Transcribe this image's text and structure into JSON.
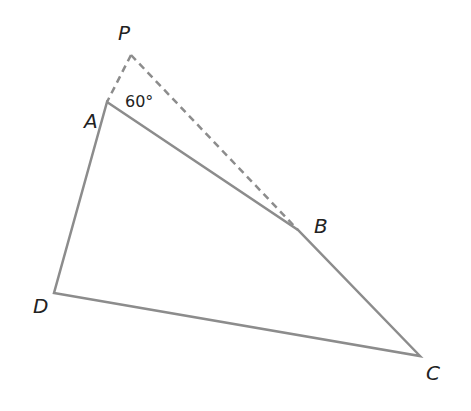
{
  "diagram": {
    "type": "geometry-quadrilateral",
    "points": {
      "P": {
        "label": "P",
        "x": 131,
        "y": 55
      },
      "A": {
        "label": "A",
        "x": 107,
        "y": 102
      },
      "B": {
        "label": "B",
        "x": 298,
        "y": 230
      },
      "C": {
        "label": "C",
        "x": 420,
        "y": 356
      },
      "D": {
        "label": "D",
        "x": 54,
        "y": 293
      }
    },
    "solid_edges": [
      [
        "A",
        "B"
      ],
      [
        "B",
        "C"
      ],
      [
        "C",
        "D"
      ],
      [
        "D",
        "A"
      ]
    ],
    "dashed_edges": [
      [
        "P",
        "A"
      ],
      [
        "P",
        "B"
      ]
    ],
    "angle_label": "60°",
    "colors": {
      "solid": "#8c8c8c",
      "dashed": "#8c8c8c",
      "text": "#222222"
    }
  }
}
